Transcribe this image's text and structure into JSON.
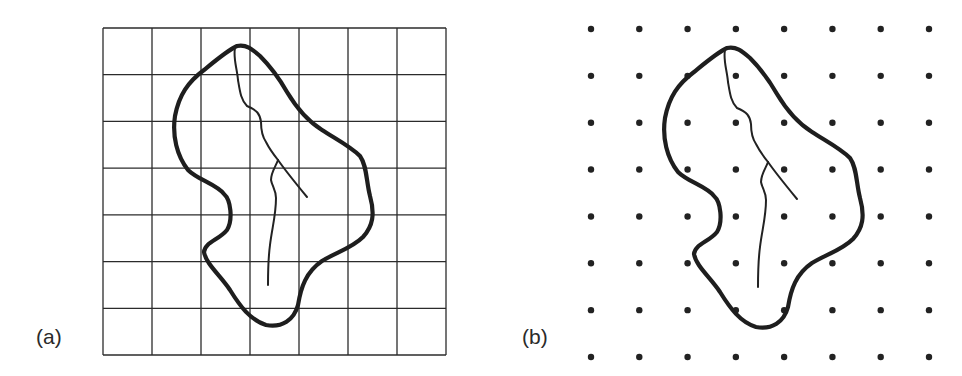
{
  "figure": {
    "panels": [
      {
        "id": "a",
        "label": "(a)",
        "description": "Watershed outline with stream network overlaid on a square grid",
        "grid_type": "lines",
        "columns": 7,
        "rows": 7
      },
      {
        "id": "b",
        "label": "(b)",
        "description": "Same watershed outline with stream network overlaid on a regular dot grid",
        "grid_type": "points",
        "columns": 8,
        "rows": 8
      }
    ],
    "colors": {
      "ink": "#222222",
      "background": "#ffffff"
    }
  }
}
